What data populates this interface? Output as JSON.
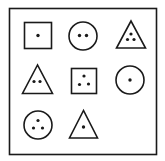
{
  "figure": {
    "type": "3x3 shape-dot matrix puzzle",
    "stroke_color": "#1a1a1a",
    "background": "#ffffff",
    "grid": [
      [
        {
          "shape": "square",
          "dots": 1
        },
        {
          "shape": "circle",
          "dots": 2
        },
        {
          "shape": "triangle",
          "dots": 3
        }
      ],
      [
        {
          "shape": "triangle",
          "dots": 2
        },
        {
          "shape": "square",
          "dots": 3
        },
        {
          "shape": "circle",
          "dots": 1
        }
      ],
      [
        {
          "shape": "circle",
          "dots": 3
        },
        {
          "shape": "triangle",
          "dots": 1
        },
        {
          "shape": "empty",
          "dots": 0
        }
      ]
    ]
  }
}
